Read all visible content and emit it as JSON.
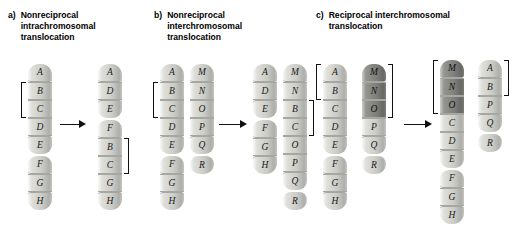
{
  "figure": {
    "title_alt": "Types of chromosomal translocations",
    "background": "#ffffff",
    "band_color": "#d9d9d4",
    "band_dark_color": "#8f8f8a",
    "ink_color": "#111111"
  },
  "panels": [
    {
      "id": "a",
      "letter": "a)",
      "caption": "Nonreciprocal\nintrachromosomal\ntranslocation",
      "before": [
        {
          "name": "chromosome-1-before",
          "bands": [
            "A",
            "B",
            "C",
            "D",
            "E",
            "F",
            "G",
            "H"
          ],
          "dark_bands": [],
          "centromere_after_index": 4,
          "bracket": {
            "side": "left",
            "from": 1,
            "to": 2
          }
        }
      ],
      "after": [
        {
          "name": "chromosome-1-after",
          "bands": [
            "A",
            "D",
            "E",
            "F",
            "B",
            "C",
            "G",
            "H"
          ],
          "dark_bands": [],
          "centromere_after_index": 2,
          "bracket": {
            "side": "right",
            "from": 4,
            "to": 5
          }
        }
      ]
    },
    {
      "id": "b",
      "letter": "b)",
      "caption": "Nonreciprocal\ninterchromosomal\ntranslocation",
      "before": [
        {
          "name": "chromosome-1-before",
          "bands": [
            "A",
            "B",
            "C",
            "D",
            "E",
            "F",
            "G",
            "H"
          ],
          "dark_bands": [],
          "centromere_after_index": 4,
          "bracket": {
            "side": "left",
            "from": 1,
            "to": 2
          }
        },
        {
          "name": "chromosome-2-before",
          "bands": [
            "M",
            "N",
            "O",
            "P",
            "Q",
            "R"
          ],
          "dark_bands": [],
          "centromere_after_index": 4,
          "bracket": null
        }
      ],
      "after": [
        {
          "name": "chromosome-1-after",
          "bands": [
            "A",
            "D",
            "E",
            "F",
            "G",
            "H"
          ],
          "dark_bands": [],
          "centromere_after_index": 2,
          "bracket": null
        },
        {
          "name": "chromosome-2-after",
          "bands": [
            "M",
            "N",
            "B",
            "C",
            "O",
            "P",
            "Q",
            "R"
          ],
          "dark_bands": [],
          "centromere_after_index": 6,
          "bracket": {
            "side": "right",
            "from": 2,
            "to": 3
          }
        }
      ]
    },
    {
      "id": "c",
      "letter": "c)",
      "caption": "Reciprocal interchromosomal\ntranslocation",
      "before": [
        {
          "name": "chromosome-1-before",
          "bands": [
            "A",
            "B",
            "C",
            "D",
            "E",
            "F",
            "G",
            "H"
          ],
          "dark_bands": [],
          "centromere_after_index": 4,
          "bracket": {
            "side": "left",
            "from": 0,
            "to": 1
          }
        },
        {
          "name": "chromosome-2-before",
          "bands": [
            "M",
            "N",
            "O",
            "P",
            "Q",
            "R"
          ],
          "dark_bands": [
            "M",
            "N",
            "O"
          ],
          "centromere_after_index": 4,
          "bracket": {
            "side": "right",
            "from": 0,
            "to": 2
          }
        }
      ],
      "after": [
        {
          "name": "chromosome-1-after",
          "bands": [
            "M",
            "N",
            "O",
            "C",
            "D",
            "E",
            "F",
            "G",
            "H"
          ],
          "dark_bands": [
            "M",
            "N",
            "O"
          ],
          "centromere_after_index": 5,
          "bracket": {
            "side": "left",
            "from": 0,
            "to": 2
          }
        },
        {
          "name": "chromosome-2-after",
          "bands": [
            "A",
            "B",
            "P",
            "Q",
            "R"
          ],
          "dark_bands": [],
          "centromere_after_index": 3,
          "bracket": {
            "side": "right",
            "from": 0,
            "to": 1
          }
        }
      ]
    }
  ],
  "arrows": [
    {
      "name": "arrow-panel-a",
      "x": 60,
      "y": 120,
      "length": 26
    },
    {
      "name": "arrow-panel-b",
      "x": 219,
      "y": 120,
      "length": 28
    },
    {
      "name": "arrow-panel-c",
      "x": 404,
      "y": 120,
      "length": 28
    }
  ],
  "layout": {
    "chrom_x": {
      "a_before": 28,
      "a_after": 98,
      "b_before_1": 160,
      "b_before_2": 190,
      "b_after_1": 253,
      "b_after_2": 283,
      "c_before_1": 323,
      "c_before_2": 362,
      "c_after_1": 440,
      "c_after_2": 478
    },
    "chrom_top": {
      "a_before": 64,
      "a_after": 64,
      "b_before_1": 64,
      "b_before_2": 64,
      "b_after_1": 64,
      "b_after_2": 64,
      "c_before_1": 64,
      "c_before_2": 64,
      "c_after_1": 60,
      "c_after_2": 60
    }
  }
}
